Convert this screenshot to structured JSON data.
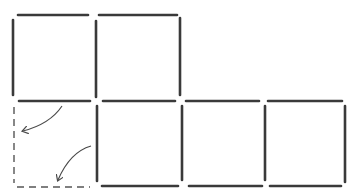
{
  "diagram": {
    "colors": {
      "background": "#ffffff",
      "stick": "#3a3a3a",
      "dashed": "#555555",
      "arrow": "#4a4a4a"
    },
    "solid_sticks": [
      {
        "id": "top-sq1",
        "x1": 18,
        "y1": 15,
        "x2": 88,
        "y2": 15
      },
      {
        "id": "top-sq2",
        "x1": 99,
        "y1": 15,
        "x2": 177,
        "y2": 15
      },
      {
        "id": "left-sq1",
        "x1": 13,
        "y1": 20,
        "x2": 13,
        "y2": 95
      },
      {
        "id": "mid-v-sq1-sq2",
        "x1": 96,
        "y1": 21,
        "x2": 96,
        "y2": 97
      },
      {
        "id": "right-sq2",
        "x1": 180,
        "y1": 18,
        "x2": 180,
        "y2": 95
      },
      {
        "id": "mid-h-sq1",
        "x1": 19,
        "y1": 101,
        "x2": 90,
        "y2": 101
      },
      {
        "id": "mid-h-sq2",
        "x1": 103,
        "y1": 101,
        "x2": 175,
        "y2": 101
      },
      {
        "id": "top-sq3",
        "x1": 186,
        "y1": 101,
        "x2": 259,
        "y2": 101
      },
      {
        "id": "top-sq4",
        "x1": 268,
        "y1": 101,
        "x2": 342,
        "y2": 101
      },
      {
        "id": "v-lower-1",
        "x1": 97,
        "y1": 106,
        "x2": 97,
        "y2": 181
      },
      {
        "id": "v-lower-2",
        "x1": 182,
        "y1": 106,
        "x2": 182,
        "y2": 180
      },
      {
        "id": "v-lower-3",
        "x1": 265,
        "y1": 106,
        "x2": 265,
        "y2": 180
      },
      {
        "id": "v-lower-4",
        "x1": 345,
        "y1": 106,
        "x2": 345,
        "y2": 182
      },
      {
        "id": "bottom-sq2",
        "x1": 102,
        "y1": 186,
        "x2": 178,
        "y2": 186
      },
      {
        "id": "bottom-sq3",
        "x1": 189,
        "y1": 186,
        "x2": 262,
        "y2": 186
      },
      {
        "id": "bottom-sq4",
        "x1": 270,
        "y1": 186,
        "x2": 341,
        "y2": 186
      }
    ],
    "dashed_sticks": [
      {
        "id": "dashed-left",
        "x1": 14,
        "y1": 107,
        "x2": 14,
        "y2": 183
      },
      {
        "id": "dashed-bottom",
        "x1": 17,
        "y1": 187,
        "x2": 90,
        "y2": 187
      }
    ],
    "arrows": [
      {
        "id": "arrow-to-left",
        "path": "M62,106 Q50,124 23,131",
        "head": [
          23,
          131
        ]
      },
      {
        "id": "arrow-to-bottom",
        "path": "M91,146 Q70,152 58,180",
        "head": [
          58,
          180
        ]
      }
    ]
  }
}
